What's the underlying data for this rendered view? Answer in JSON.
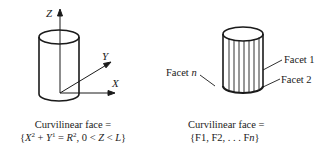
{
  "left_figure": {
    "axis_labels": {
      "z": "Z",
      "y": "Y",
      "x": "X"
    },
    "caption_line1": "Curvilinear face =",
    "caption_line2": {
      "open": "{",
      "x": "X",
      "x_exp": "2",
      "plus": " + ",
      "y": "Y",
      "y_exp": "1",
      "eq": " = ",
      "r": "R",
      "r_exp": "2",
      "rest_a": ", 0 < ",
      "z": "Z",
      "lt": " < ",
      "l": "L",
      "close": "}"
    }
  },
  "right_figure": {
    "facet_labels": {
      "facet_1": "Facet 1",
      "facet_2": "Facet 2",
      "facet_n_word": "Facet",
      "facet_n_var": "n"
    },
    "caption_line1": "Curvilinear face =",
    "caption_line2": {
      "open": "{F1, F2, . . . F",
      "var": "n",
      "close": "}"
    }
  }
}
